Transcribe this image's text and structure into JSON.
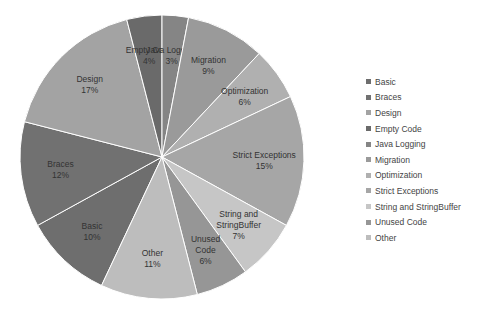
{
  "chart_data": {
    "type": "pie",
    "title": "",
    "categories": [
      "Basic",
      "Braces",
      "Design",
      "Empty Code",
      "Java Logging",
      "Migration",
      "Optimization",
      "Strict Exceptions",
      "String and StringBuffer",
      "Unused Code",
      "Other"
    ],
    "values": [
      10,
      12,
      17,
      4,
      3,
      9,
      6,
      15,
      7,
      6,
      11
    ],
    "labels": [
      "Basic\n10%",
      "Braces\n12%",
      "Design\n17%",
      "Empty Code\n4%",
      "Java Logging\n3%",
      "Migration\n9%",
      "Optimization\n6%",
      "Strict Exceptions\n15%",
      "String and\nStringBuffer\n7%",
      "Unused\nCode\n6%",
      "Other\n11%"
    ],
    "colors": [
      "#6e6e6e",
      "#717171",
      "#a3a3a3",
      "#6a6a6a",
      "#858585",
      "#9a9a9a",
      "#b0b0b0",
      "#a6a6a6",
      "#c6c6c6",
      "#969696",
      "#bdbdbd"
    ],
    "legend_position": "right",
    "start_angle_deg": 205.2
  }
}
